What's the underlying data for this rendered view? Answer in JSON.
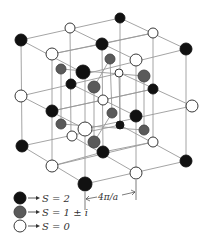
{
  "figure": {
    "type": "lattice-diagram",
    "colors": {
      "s2": "#111111",
      "s1": "#5a5a5a",
      "s0": "#ffffff",
      "edge": "#9a9a9a",
      "stroke": "#222222"
    },
    "dimension": {
      "label": "4π/a"
    },
    "legend": [
      {
        "key": "s2",
        "label": "S = 2"
      },
      {
        "key": "s1",
        "label": "S = 1 ± i"
      },
      {
        "key": "s0",
        "label": "S = 0"
      }
    ],
    "nodes": [
      {
        "x": 120,
        "y": 18,
        "k": "s2",
        "r": 5
      },
      {
        "x": 70,
        "y": 28,
        "k": "s0",
        "r": 5
      },
      {
        "x": 153,
        "y": 33,
        "k": "s0",
        "r": 5
      },
      {
        "x": 21,
        "y": 40,
        "k": "s2",
        "r": 6
      },
      {
        "x": 102,
        "y": 44,
        "k": "s2",
        "r": 6
      },
      {
        "x": 186,
        "y": 49,
        "k": "s2",
        "r": 6
      },
      {
        "x": 52,
        "y": 54,
        "k": "s0",
        "r": 6
      },
      {
        "x": 136,
        "y": 60,
        "k": "s0",
        "r": 6
      },
      {
        "x": 110,
        "y": 59,
        "k": "s1",
        "r": 5
      },
      {
        "x": 61,
        "y": 69,
        "k": "s1",
        "r": 5
      },
      {
        "x": 119,
        "y": 73,
        "k": "s0",
        "r": 4
      },
      {
        "x": 83,
        "y": 72,
        "k": "s2",
        "r": 7
      },
      {
        "x": 144,
        "y": 76,
        "k": "s1",
        "r": 6
      },
      {
        "x": 71,
        "y": 84,
        "k": "s2",
        "r": 5
      },
      {
        "x": 94,
        "y": 87,
        "k": "s1",
        "r": 6
      },
      {
        "x": 153,
        "y": 89,
        "k": "s2",
        "r": 5
      },
      {
        "x": 21,
        "y": 96,
        "k": "s0",
        "r": 6
      },
      {
        "x": 103,
        "y": 100,
        "k": "s0",
        "r": 5
      },
      {
        "x": 192,
        "y": 106,
        "k": "s0",
        "r": 6
      },
      {
        "x": 52,
        "y": 111,
        "k": "s2",
        "r": 6
      },
      {
        "x": 112,
        "y": 113,
        "k": "s1",
        "r": 5
      },
      {
        "x": 136,
        "y": 116,
        "k": "s2",
        "r": 6
      },
      {
        "x": 61,
        "y": 124,
        "k": "s1",
        "r": 5
      },
      {
        "x": 85,
        "y": 129,
        "k": "s0",
        "r": 7
      },
      {
        "x": 120,
        "y": 125,
        "k": "s2",
        "r": 4
      },
      {
        "x": 72,
        "y": 136,
        "k": "s0",
        "r": 5
      },
      {
        "x": 144,
        "y": 130,
        "k": "s1",
        "r": 5
      },
      {
        "x": 94,
        "y": 142,
        "k": "s1",
        "r": 6
      },
      {
        "x": 153,
        "y": 142,
        "k": "s0",
        "r": 5
      },
      {
        "x": 22,
        "y": 146,
        "k": "s2",
        "r": 6
      },
      {
        "x": 103,
        "y": 152,
        "k": "s2",
        "r": 6
      },
      {
        "x": 52,
        "y": 166,
        "k": "s0",
        "r": 6
      },
      {
        "x": 186,
        "y": 161,
        "k": "s2",
        "r": 6
      },
      {
        "x": 136,
        "y": 173,
        "k": "s0",
        "r": 6
      },
      {
        "x": 85,
        "y": 184,
        "k": "s2",
        "r": 7
      }
    ]
  }
}
